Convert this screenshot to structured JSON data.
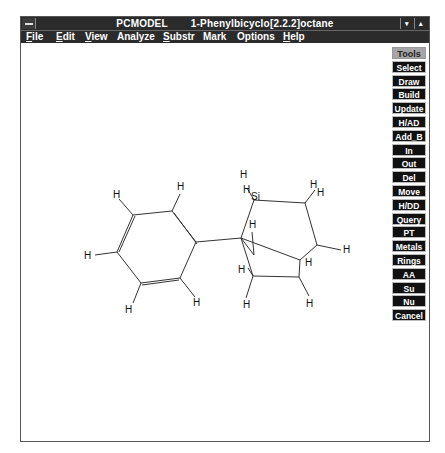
{
  "window": {
    "app_name": "PCMODEL",
    "document_title": "1-Phenylbicyclo[2.2.2]octane",
    "minimize_symbol": "▾",
    "maximize_symbol": "▴"
  },
  "menubar": {
    "items": [
      {
        "label": "File",
        "mnemonic": "F",
        "rest": "ile"
      },
      {
        "label": "Edit",
        "mnemonic": "E",
        "rest": "dit"
      },
      {
        "label": "View",
        "mnemonic": "V",
        "rest": "iew"
      },
      {
        "label": "Analyze",
        "mnemonic": "",
        "rest": "Analyze"
      },
      {
        "label": "Substr",
        "mnemonic": "S",
        "rest": "ubstr"
      },
      {
        "label": "Mark",
        "mnemonic": "",
        "rest": "Mark"
      },
      {
        "label": "Options",
        "mnemonic": "",
        "rest": "Options"
      },
      {
        "label": "Help",
        "mnemonic": "H",
        "rest": "elp"
      }
    ]
  },
  "tools": {
    "header": "Tools",
    "buttons": [
      "Select",
      "Draw",
      "Build",
      "Update",
      "H/AD",
      "Add_B",
      "In",
      "Out",
      "Del",
      "Move",
      "H/DD",
      "Query",
      "PT",
      "Metals",
      "Rings",
      "AA",
      "Su",
      "Nu",
      "Cancel"
    ]
  },
  "molecule": {
    "name": "1-Phenylbicyclo[2.2.2]octane",
    "atom_labels": {
      "H": "H",
      "Si": "Si"
    }
  }
}
